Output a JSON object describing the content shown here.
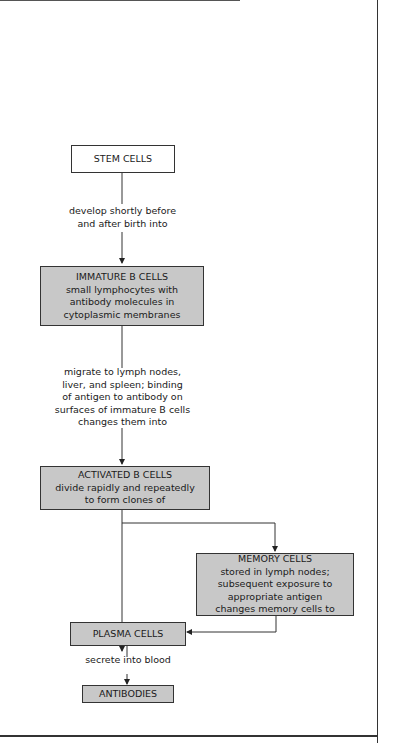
{
  "diagram": {
    "nodes": [
      {
        "id": "stem",
        "title": "STEM CELLS",
        "lines": []
      },
      {
        "id": "immature",
        "title": "IMMATURE B CELLS",
        "lines": [
          "small lymphocytes with",
          "antibody molecules in",
          "cytoplasmic membranes"
        ]
      },
      {
        "id": "activated",
        "title": "ACTIVATED B CELLS",
        "lines": [
          "divide rapidly and repeatedly",
          "to form clones of"
        ]
      },
      {
        "id": "memory",
        "title": "MEMORY CELLS",
        "lines": [
          "stored in lymph nodes;",
          "subsequent exposure to",
          "appropriate antigen",
          "changes memory cells to"
        ]
      },
      {
        "id": "plasma",
        "title": "PLASMA CELLS",
        "lines": []
      },
      {
        "id": "antibodies",
        "title": "ANTIBODIES",
        "lines": []
      }
    ],
    "edges": [
      {
        "from": "stem",
        "to": "immature",
        "label_lines": [
          "develop shortly before",
          "and after birth into"
        ]
      },
      {
        "from": "immature",
        "to": "activated",
        "label_lines": [
          "migrate to lymph nodes,",
          "liver, and spleen; binding",
          "of antigen to antibody on",
          "surfaces of immature B cells",
          "changes them into"
        ]
      },
      {
        "from": "activated",
        "to": "memory",
        "label_lines": []
      },
      {
        "from": "activated",
        "to": "plasma",
        "label_lines": []
      },
      {
        "from": "memory",
        "to": "plasma",
        "label_lines": []
      },
      {
        "from": "plasma",
        "to": "antibodies",
        "label_lines": [
          "secrete into blood"
        ]
      }
    ]
  }
}
